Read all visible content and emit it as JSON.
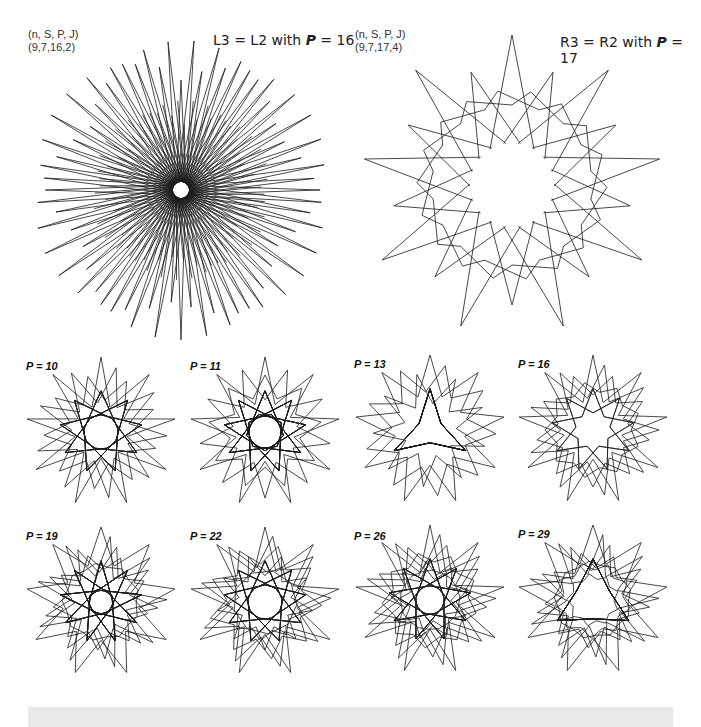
{
  "top_left": {
    "param_header": "(n, S, P, J)",
    "param_values": "(9,7,16,2)",
    "title_prefix": "L3 = L2 with ",
    "title_var": "P",
    "title_suffix": " = 16",
    "n": 9,
    "S": 7,
    "P": 16,
    "J": 2
  },
  "top_right": {
    "param_header": "(n, S, P, J)",
    "param_values": "(9,7,17,4)",
    "title_prefix": "R3 = R2 with ",
    "title_var": "P",
    "title_suffix": " = 17",
    "n": 9,
    "S": 7,
    "P": 17,
    "J": 4
  },
  "small_figures": [
    {
      "label": "P = 10",
      "P": 10
    },
    {
      "label": "P = 11",
      "P": 11
    },
    {
      "label": "P = 13",
      "P": 13
    },
    {
      "label": "P = 16",
      "P": 16
    },
    {
      "label": "P = 19",
      "P": 19
    },
    {
      "label": "P = 22",
      "P": 22
    },
    {
      "label": "P = 26",
      "P": 26
    },
    {
      "label": "P = 29",
      "P": 29
    }
  ],
  "colors": {
    "stroke": "#1a1a1a",
    "background": "#ffffff",
    "bottom_bar": "#e9e9e9"
  }
}
